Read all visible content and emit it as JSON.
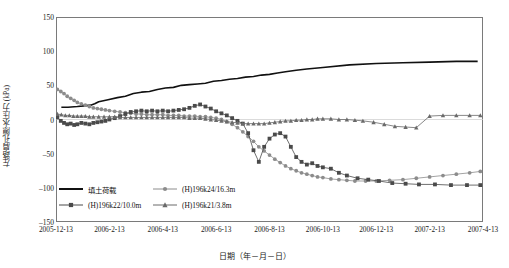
{
  "chart_data": {
    "type": "line",
    "title": "",
    "xlabel": "日期（年－月－日）",
    "ylabel": "左路肩孔隙水压力 (kPa)",
    "ylim": [
      -150,
      150
    ],
    "yticks": [
      150,
      100,
      50,
      0,
      -50,
      -100,
      -150
    ],
    "xticks": [
      "2005-12-13",
      "2006-2-13",
      "2006-4-13",
      "2006-6-13",
      "2006-8-13",
      "2006-10-13",
      "2006-12-13",
      "2007-2-13",
      "2007-4-13"
    ],
    "xlim": [
      0,
      16
    ],
    "grid": false,
    "legend_position": "inside-bottom-left",
    "series": [
      {
        "name": "填土荷载",
        "marker": "none",
        "color": "#111111",
        "x": [
          0.2,
          0.45,
          0.8,
          1.05,
          1.3,
          1.45,
          1.6,
          1.95,
          2.3,
          2.6,
          2.9,
          3.2,
          3.5,
          3.8,
          4.1,
          4.4,
          4.7,
          5.0,
          5.3,
          5.6,
          5.9,
          6.2,
          6.5,
          6.8,
          7.1,
          7.4,
          7.7,
          8.0,
          8.3,
          8.6,
          9.0,
          9.4,
          10.0,
          11.0,
          12.0,
          13.0,
          14.0,
          15.0,
          15.8
        ],
        "values": [
          18,
          18,
          19,
          20,
          21,
          23,
          26,
          29,
          32,
          34,
          38,
          40,
          41,
          44,
          46,
          47,
          50,
          51,
          52,
          53,
          56,
          57,
          59,
          60,
          62,
          63,
          65,
          66,
          68,
          70,
          72,
          74,
          76,
          80,
          82,
          83,
          84,
          85,
          85
        ]
      },
      {
        "name": "(H)196k24/16.3m",
        "marker": "circle",
        "color": "#8c8c8c",
        "x": [
          0.05,
          0.18,
          0.3,
          0.42,
          0.55,
          0.68,
          0.8,
          0.95,
          1.1,
          1.25,
          1.4,
          1.55,
          1.7,
          1.85,
          2.0,
          2.2,
          2.4,
          2.6,
          2.8,
          3.0,
          3.2,
          3.4,
          3.6,
          3.8,
          4.0,
          4.2,
          4.4,
          4.6,
          4.8,
          5.0,
          5.2,
          5.4,
          5.6,
          5.8,
          6.0,
          6.2,
          6.4,
          6.6,
          6.8,
          7.0,
          7.2,
          7.4,
          7.6,
          7.8,
          8.0,
          8.2,
          8.4,
          8.6,
          8.8,
          9.0,
          9.2,
          9.4,
          9.6,
          9.8,
          10.0,
          10.3,
          10.6,
          10.9,
          11.2,
          11.6,
          12.0,
          12.5,
          13.0,
          13.5,
          14.0,
          14.5,
          15.0,
          15.5,
          15.9
        ],
        "values": [
          44,
          41,
          38,
          34,
          31,
          28,
          25,
          23,
          21,
          19,
          17,
          16,
          15,
          14,
          13,
          12,
          11,
          10,
          9,
          8,
          8,
          7,
          7,
          7,
          7,
          6,
          6,
          6,
          5,
          5,
          5,
          4,
          4,
          3,
          2,
          0,
          -3,
          -7,
          -12,
          -18,
          -25,
          -32,
          -40,
          -46,
          -52,
          -58,
          -63,
          -68,
          -72,
          -75,
          -78,
          -80,
          -82,
          -84,
          -85,
          -87,
          -88,
          -89,
          -90,
          -90,
          -90,
          -89,
          -88,
          -86,
          -84,
          -82,
          -80,
          -78,
          -76
        ]
      },
      {
        "name": "(H)196k22/10.0m",
        "marker": "square",
        "color": "#4a4a4a",
        "x": [
          0.05,
          0.18,
          0.3,
          0.42,
          0.55,
          0.68,
          0.8,
          0.95,
          1.1,
          1.25,
          1.4,
          1.55,
          1.7,
          1.85,
          2.0,
          2.2,
          2.4,
          2.6,
          2.8,
          3.0,
          3.2,
          3.4,
          3.6,
          3.8,
          4.0,
          4.2,
          4.4,
          4.6,
          4.8,
          5.0,
          5.2,
          5.4,
          5.6,
          5.8,
          6.0,
          6.2,
          6.4,
          6.6,
          6.8,
          7.0,
          7.2,
          7.4,
          7.6,
          7.8,
          8.0,
          8.2,
          8.4,
          8.6,
          8.8,
          9.0,
          9.2,
          9.4,
          9.6,
          9.8,
          10.0,
          10.3,
          10.6,
          10.9,
          11.3,
          11.7,
          12.1,
          12.6,
          13.1,
          13.6,
          14.2,
          14.8,
          15.4,
          15.9
        ],
        "values": [
          3,
          -2,
          -5,
          -7,
          -6,
          -8,
          -7,
          -5,
          -6,
          -7,
          -5,
          -4,
          -3,
          -2,
          0,
          2,
          5,
          8,
          11,
          12,
          13,
          12,
          13,
          12,
          13,
          12,
          13,
          14,
          15,
          17,
          20,
          22,
          19,
          16,
          12,
          9,
          6,
          2,
          -2,
          -6,
          -20,
          -45,
          -62,
          -40,
          -28,
          -22,
          -20,
          -25,
          -40,
          -55,
          -62,
          -66,
          -64,
          -68,
          -70,
          -72,
          -78,
          -82,
          -86,
          -88,
          -90,
          -93,
          -94,
          -95,
          -95,
          -96,
          -96,
          -96
        ]
      },
      {
        "name": "(H)196k21/3.8m",
        "marker": "triangle",
        "color": "#6a6a6a",
        "x": [
          0.05,
          0.2,
          0.35,
          0.5,
          0.65,
          0.8,
          0.95,
          1.1,
          1.25,
          1.4,
          1.6,
          1.8,
          2.0,
          2.2,
          2.4,
          2.6,
          2.8,
          3.0,
          3.2,
          3.4,
          3.6,
          3.8,
          4.0,
          4.2,
          4.4,
          4.6,
          4.8,
          5.0,
          5.2,
          5.4,
          5.6,
          5.8,
          6.0,
          6.2,
          6.4,
          6.6,
          6.8,
          7.0,
          7.2,
          7.4,
          7.6,
          7.8,
          8.0,
          8.2,
          8.4,
          8.6,
          8.8,
          9.0,
          9.2,
          9.4,
          9.6,
          9.8,
          10.0,
          10.3,
          10.6,
          10.9,
          11.2,
          11.5,
          11.9,
          12.3,
          12.7,
          13.1,
          13.5,
          14.0,
          14.5,
          15.0,
          15.5,
          15.9
        ],
        "values": [
          8,
          7,
          6,
          6,
          5,
          5,
          5,
          5,
          4,
          4,
          4,
          4,
          4,
          4,
          3,
          3,
          3,
          3,
          3,
          3,
          3,
          3,
          3,
          3,
          3,
          3,
          3,
          2,
          2,
          2,
          1,
          0,
          -1,
          -2,
          -3,
          -4,
          -5,
          -6,
          -6,
          -6,
          -6,
          -6,
          -5,
          -4,
          -3,
          -2,
          -2,
          -1,
          -1,
          0,
          0,
          1,
          1,
          1,
          0,
          0,
          -1,
          -2,
          -4,
          -7,
          -10,
          -11,
          -12,
          5,
          6,
          6,
          6,
          6
        ]
      }
    ]
  }
}
